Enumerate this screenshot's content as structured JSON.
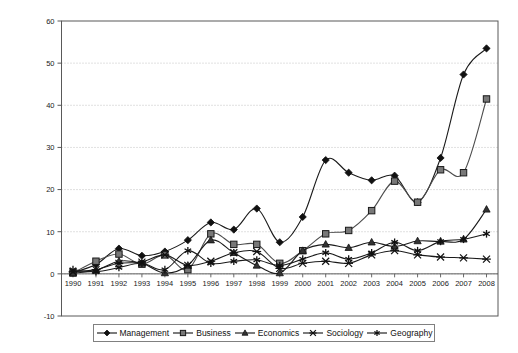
{
  "chart_data": {
    "type": "line",
    "title": "",
    "xlabel": "",
    "ylabel": "",
    "xlim": [
      1990,
      2008
    ],
    "ylim": [
      -10,
      60
    ],
    "ytick_values": [
      -10,
      0,
      10,
      20,
      30,
      40,
      50,
      60
    ],
    "ytick_labels": [
      "-10",
      "0",
      "10",
      "20",
      "30",
      "40",
      "50",
      "60"
    ],
    "grid": "horizontal-dotted",
    "legend_position": "bottom-outside",
    "categories": [
      1990,
      1991,
      1992,
      1993,
      1994,
      1995,
      1996,
      1997,
      1998,
      1999,
      2000,
      2001,
      2002,
      2003,
      2004,
      2005,
      2006,
      2007,
      2008
    ],
    "xtick_labels": [
      "1990",
      "1991",
      "1992",
      "1993",
      "1994",
      "1995",
      "1996",
      "1997",
      "1998",
      "1999",
      "2000",
      "2001",
      "2002",
      "2003",
      "2004",
      "2005",
      "2006",
      "2007",
      "2008"
    ],
    "series": [
      {
        "name": "Management",
        "marker": "diamond",
        "color": "#1a1a1a",
        "values": [
          0.3,
          2.2,
          6.0,
          4.3,
          5.3,
          8.0,
          12.2,
          10.5,
          15.5,
          7.5,
          13.5,
          27.0,
          24.0,
          22.2,
          23.3,
          17.0,
          27.5,
          47.3,
          53.5
        ]
      },
      {
        "name": "Business",
        "marker": "square",
        "color": "#4d4d4d",
        "values": [
          0.2,
          3.0,
          4.7,
          2.3,
          4.5,
          1.0,
          9.5,
          7.0,
          7.0,
          2.5,
          5.5,
          9.5,
          10.3,
          15.0,
          22.0,
          17.0,
          24.7,
          24.0,
          41.5
        ]
      },
      {
        "name": "Economics",
        "marker": "triangle",
        "color": "#1a1a1a",
        "values": [
          0.2,
          0.8,
          3.0,
          2.5,
          0.2,
          2.0,
          8.0,
          5.0,
          2.0,
          0.2,
          5.5,
          7.0,
          6.2,
          7.5,
          6.5,
          7.8,
          7.7,
          8.2,
          15.3
        ]
      },
      {
        "name": "Sociology",
        "marker": "cross",
        "color": "#1a1a1a",
        "values": [
          0.5,
          1.0,
          2.5,
          2.8,
          4.5,
          2.0,
          3.0,
          5.0,
          5.3,
          1.3,
          2.5,
          3.0,
          2.5,
          4.5,
          5.5,
          4.5,
          4.0,
          3.8,
          3.5
        ]
      },
      {
        "name": "Geography",
        "marker": "star",
        "color": "#1a1a1a",
        "values": [
          1.0,
          0.5,
          1.5,
          2.5,
          1.0,
          5.5,
          2.5,
          3.0,
          3.3,
          2.0,
          3.5,
          5.0,
          3.5,
          5.0,
          7.5,
          5.5,
          7.7,
          8.2,
          9.5
        ]
      }
    ]
  },
  "legend": {
    "items": [
      {
        "label": "Management",
        "marker": "diamond"
      },
      {
        "label": "Business",
        "marker": "square"
      },
      {
        "label": "Economics",
        "marker": "triangle"
      },
      {
        "label": "Sociology",
        "marker": "cross"
      },
      {
        "label": "Geography",
        "marker": "star"
      }
    ]
  }
}
